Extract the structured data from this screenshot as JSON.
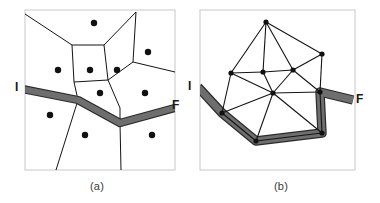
{
  "figure": {
    "width": 380,
    "height": 203,
    "background": "#ffffff",
    "panels": [
      {
        "id": "panel-a",
        "caption": "(a)",
        "caption_pos": [
          90,
          180
        ],
        "type": "voronoi-diagram",
        "frame": {
          "x": 25,
          "y": 10,
          "w": 150,
          "h": 160,
          "stroke": "#c8c8c8"
        },
        "site_color": "#111111",
        "site_radius": 3.2,
        "sites": [
          [
            94,
            23
          ],
          [
            148,
            52
          ],
          [
            58,
            70
          ],
          [
            90,
            70
          ],
          [
            117,
            70
          ],
          [
            100,
            93
          ],
          [
            145,
            93
          ],
          [
            50,
            115
          ],
          [
            85,
            135
          ],
          [
            152,
            135
          ]
        ],
        "cell_edges": [
          [
            [
              25,
              14
            ],
            [
              72,
              45
            ]
          ],
          [
            [
              72,
              45
            ],
            [
              104,
              45
            ]
          ],
          [
            [
              104,
              45
            ],
            [
              136,
              12
            ]
          ],
          [
            [
              72,
              45
            ],
            [
              74,
              82
            ]
          ],
          [
            [
              104,
              45
            ],
            [
              108,
              80
            ]
          ],
          [
            [
              74,
              82
            ],
            [
              108,
              80
            ]
          ],
          [
            [
              108,
              80
            ],
            [
              133,
              62
            ]
          ],
          [
            [
              133,
              62
            ],
            [
              136,
              12
            ]
          ],
          [
            [
              133,
              62
            ],
            [
              175,
              72
            ]
          ],
          [
            [
              74,
              82
            ],
            [
              78,
              100
            ]
          ],
          [
            [
              108,
              80
            ],
            [
              120,
              108
            ]
          ],
          [
            [
              120,
              108
            ],
            [
              120,
              123
            ]
          ],
          [
            [
              78,
              100
            ],
            [
              56,
              170
            ]
          ],
          [
            [
              120,
              123
            ],
            [
              121,
              170
            ]
          ],
          [
            [
              25,
              89
            ],
            [
              78,
              100
            ]
          ],
          [
            [
              78,
              100
            ],
            [
              120,
              123
            ]
          ],
          [
            [
              120,
              123
            ],
            [
              175,
              108
            ]
          ]
        ],
        "path": {
          "label": "shortest-path-corridor",
          "fill": "#6e6e6e",
          "outline": "#2b2b2b",
          "width": 6,
          "points": [
            [
              22,
              89
            ],
            [
              78,
              100
            ],
            [
              120,
              123
            ],
            [
              175,
              108
            ]
          ]
        },
        "endpoints": [
          {
            "name": "I",
            "label": "I",
            "pos": [
              15,
              80
            ],
            "anchor": [
              22,
              89
            ]
          },
          {
            "name": "F",
            "label": "F",
            "pos": [
              172,
              98
            ],
            "anchor": [
              175,
              108
            ]
          }
        ]
      },
      {
        "id": "panel-b",
        "caption": "(b)",
        "caption_pos": [
          274,
          180
        ],
        "type": "delaunay-triangulation",
        "frame": {
          "x": 200,
          "y": 10,
          "w": 155,
          "h": 160,
          "stroke": "#c8c8c8"
        },
        "node_color": "#111111",
        "node_radius": 2.6,
        "edge_color": "#141414",
        "nodes": [
          {
            "id": 0,
            "pos": [
              266,
              22
            ]
          },
          {
            "id": 1,
            "pos": [
              322,
              54
            ]
          },
          {
            "id": 2,
            "pos": [
              231,
              73
            ]
          },
          {
            "id": 3,
            "pos": [
              263,
              72
            ]
          },
          {
            "id": 4,
            "pos": [
              293,
              70
            ]
          },
          {
            "id": 5,
            "pos": [
              273,
              93
            ]
          },
          {
            "id": 6,
            "pos": [
              320,
              92
            ]
          },
          {
            "id": 7,
            "pos": [
              222,
              113
            ]
          },
          {
            "id": 8,
            "pos": [
              322,
              133
            ]
          },
          {
            "id": 9,
            "pos": [
              256,
              141
            ]
          }
        ],
        "edges": [
          [
            0,
            2
          ],
          [
            0,
            3
          ],
          [
            0,
            4
          ],
          [
            0,
            1
          ],
          [
            1,
            4
          ],
          [
            1,
            6
          ],
          [
            2,
            3
          ],
          [
            2,
            5
          ],
          [
            2,
            7
          ],
          [
            3,
            4
          ],
          [
            3,
            5
          ],
          [
            4,
            5
          ],
          [
            4,
            6
          ],
          [
            5,
            6
          ],
          [
            5,
            7
          ],
          [
            5,
            9
          ],
          [
            5,
            8
          ],
          [
            6,
            8
          ],
          [
            7,
            9
          ],
          [
            8,
            9
          ]
        ],
        "path": {
          "label": "shortest-path-corridor",
          "fill": "#6e6e6e",
          "outline": "#2b2b2b",
          "width": 7,
          "points": [
            [
              198,
              87
            ],
            [
              222,
              113
            ],
            [
              256,
              141
            ],
            [
              322,
              133
            ],
            [
              320,
              92
            ],
            [
              353,
              100
            ]
          ]
        },
        "endpoints": [
          {
            "name": "I",
            "label": "I",
            "pos": [
              188,
              79
            ],
            "anchor": [
              198,
              87
            ]
          },
          {
            "name": "F",
            "label": "F",
            "pos": [
              356,
              92
            ],
            "anchor": [
              353,
              100
            ]
          }
        ]
      }
    ]
  }
}
